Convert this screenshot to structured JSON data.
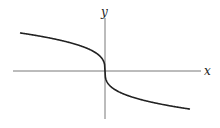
{
  "chart_data": {
    "type": "line",
    "title": "",
    "xlabel": "x",
    "ylabel": "y",
    "function": "y = -cbrt(x)",
    "grid": false,
    "legend": null,
    "x": [
      -4,
      -3,
      -2,
      -1,
      -0.5,
      -0.1,
      0,
      0.1,
      0.5,
      1,
      2,
      3,
      4
    ],
    "series": [
      {
        "name": "curve",
        "values": [
          1.587,
          1.442,
          1.26,
          1.0,
          0.794,
          0.464,
          0,
          -0.464,
          -0.794,
          -1.0,
          -1.26,
          -1.442,
          -1.587
        ]
      }
    ],
    "xlim": [
      -4.3,
      4.3
    ],
    "ylim": [
      -2.5,
      2.8
    ],
    "ticks": {
      "x": [],
      "y": []
    }
  },
  "labels": {
    "x_axis": "x",
    "y_axis": "y"
  },
  "colors": {
    "curve": "#222222",
    "axis": "#555555"
  }
}
